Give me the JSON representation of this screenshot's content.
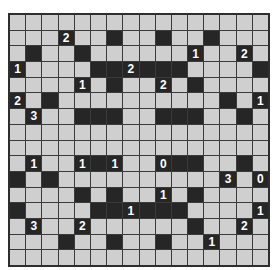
{
  "puzzle": {
    "type": "Akari (Light Up)",
    "rows": 16,
    "cols": 16,
    "colors": {
      "white_cell": "#cfcfcf",
      "black_cell": "#262626",
      "grid_line": "#3a3a3a",
      "clue_text": "#ffffff"
    },
    "grid": [
      "................",
      "...2..#..#..#...",
      ".#..#......1..2.",
      "1....##2###....#",
      "....1.#..2.#....",
      "2.#..........#.1",
      ".3..###..###..#.",
      "................",
      "................",
      ".1..1#1..0##..#.",
      "#.#..........3.0",
      "....#.#..1.#....",
      "#....##1###....1",
      ".3..2......#..2.",
      "...#..#..#..1...",
      "................"
    ]
  }
}
